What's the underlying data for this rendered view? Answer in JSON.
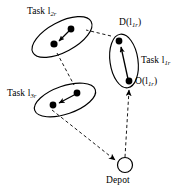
{
  "figure": {
    "type": "node-link-diagram",
    "background_color": "#ffffff",
    "ink_color": "#000000",
    "labels": {
      "task2": "Task l",
      "task2_sub": "2r",
      "task3": "Task l",
      "task3_sub": "3r",
      "task1": "Task l",
      "task1_sub": "1r",
      "destination": "D(l",
      "destination_sub": "1r",
      "destination_close": ")",
      "origin": "O(l",
      "origin_sub": "1r",
      "origin_close": ")",
      "depot": "Depot"
    },
    "nodes": [
      {
        "id": "task2-pickup",
        "x": 71,
        "y": 29,
        "kind": "filled-dot",
        "task": "l2r"
      },
      {
        "id": "task2-delivery",
        "x": 54,
        "y": 44,
        "kind": "filled-dot",
        "task": "l2r"
      },
      {
        "id": "task3-pickup",
        "x": 77,
        "y": 93,
        "kind": "filled-dot",
        "task": "l3r"
      },
      {
        "id": "task3-delivery",
        "x": 53,
        "y": 105,
        "kind": "filled-dot",
        "task": "l3r"
      },
      {
        "id": "task1-destination",
        "x": 119,
        "y": 41,
        "kind": "filled-dot",
        "task": "l1r"
      },
      {
        "id": "task1-origin",
        "x": 129,
        "y": 81,
        "kind": "filled-dot",
        "task": "l1r"
      },
      {
        "id": "depot",
        "x": 125,
        "y": 165,
        "kind": "hollow-circle",
        "task": "depot"
      }
    ],
    "ellipses": [
      {
        "id": "task2-ellipse",
        "cx": 62,
        "cy": 37,
        "rx": 33,
        "ry": 15,
        "rotation_deg": -28
      },
      {
        "id": "task3-ellipse",
        "cx": 65,
        "cy": 100,
        "rx": 32,
        "ry": 14,
        "rotation_deg": -19
      },
      {
        "id": "task1-ellipse",
        "cx": 124,
        "cy": 61,
        "rx": 14,
        "ry": 27,
        "rotation_deg": -8
      }
    ],
    "task_edges": [
      {
        "id": "task2-edge",
        "from": "task2-pickup",
        "to": "task2-delivery",
        "style": "solid",
        "arrow": true
      },
      {
        "id": "task3-edge",
        "from": "task3-pickup",
        "to": "task3-delivery",
        "style": "solid",
        "arrow": true
      },
      {
        "id": "task1-edge",
        "from": "task1-origin",
        "to": "task1-destination",
        "style": "solid",
        "arrow": true
      }
    ],
    "route_edges": [
      {
        "id": "route-depot-to-origin",
        "from": "depot",
        "to": "task1-origin",
        "style": "dashed",
        "arrow": true
      },
      {
        "id": "route-destination-to-task2",
        "from": "task1-destination",
        "to": "task2-pickup",
        "style": "dashed",
        "arrow": false
      },
      {
        "id": "route-task2-to-task3",
        "from": "task2-delivery",
        "to": "task3-pickup",
        "style": "dashed",
        "arrow": false
      },
      {
        "id": "route-task3-to-depot",
        "from": "task3-delivery",
        "to": "depot",
        "style": "dashed",
        "arrow": true
      }
    ]
  }
}
